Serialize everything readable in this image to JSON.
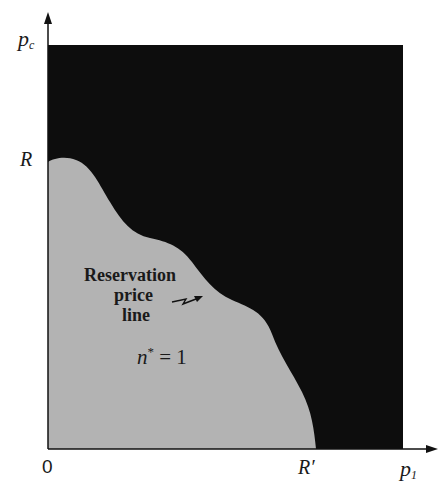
{
  "diagram": {
    "type": "region-plot",
    "axes": {
      "x_label": "p",
      "x_subscript": "1",
      "y_label": "p",
      "y_subscript": "c",
      "origin_label": "0",
      "y_tick_label": "R",
      "x_tick_label": "R′"
    },
    "regions": [
      {
        "name": "outer-region",
        "color": "#0d0d0d"
      },
      {
        "name": "n-star-1-region",
        "color": "#b3b3b3",
        "label": "n* = 1"
      }
    ],
    "annotation": {
      "line1": "Reservation",
      "line2": "price",
      "line3": "line"
    },
    "region_label": {
      "n": "n",
      "star": "*",
      "eq": " = 1"
    }
  }
}
